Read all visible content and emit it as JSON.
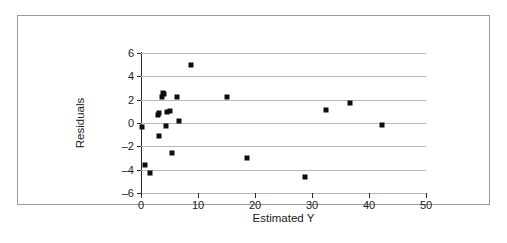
{
  "figure": {
    "border_color": "#9a9a9a",
    "background": "#ffffff"
  },
  "ghost_caption": "",
  "chart_data": {
    "type": "scatter",
    "title": "",
    "xlabel": "Estimated Y",
    "ylabel": "Residuals",
    "xlim": [
      0,
      50
    ],
    "ylim": [
      -6,
      6
    ],
    "xticks": [
      0,
      10,
      20,
      30,
      40,
      50
    ],
    "yticks": [
      -6,
      -4,
      -2,
      0,
      2,
      4,
      6
    ],
    "xtick_labels": [
      "0",
      "10",
      "20",
      "30",
      "40",
      "50"
    ],
    "ytick_labels": [
      "-6",
      "-4",
      "-2",
      "0",
      "2",
      "4",
      "6"
    ],
    "gridlines": {
      "horizontal": true,
      "vertical": false,
      "color": "#b9b9b9",
      "values": [
        -6,
        -4,
        -2,
        0,
        2,
        4,
        6
      ]
    },
    "marker": {
      "shape": "square",
      "color": "#0d0d0d",
      "size_px": 5
    },
    "series": [
      {
        "name": "Residuals",
        "points": [
          [
            0.2,
            -0.35
          ],
          [
            0.7,
            -3.6
          ],
          [
            1.5,
            -4.3
          ],
          [
            2.9,
            0.7
          ],
          [
            3.1,
            0.85
          ],
          [
            3.2,
            -1.1
          ],
          [
            3.6,
            2.2
          ],
          [
            3.9,
            2.55
          ],
          [
            4.1,
            2.45
          ],
          [
            4.3,
            -0.25
          ],
          [
            4.6,
            0.95
          ],
          [
            5.1,
            1.0
          ],
          [
            5.5,
            -2.6
          ],
          [
            6.3,
            2.25
          ],
          [
            6.6,
            0.2
          ],
          [
            8.7,
            5.0
          ],
          [
            15.0,
            2.2
          ],
          [
            18.6,
            -3.0
          ],
          [
            28.8,
            -4.6
          ],
          [
            32.4,
            1.1
          ],
          [
            36.6,
            1.75
          ],
          [
            42.2,
            -0.15
          ]
        ]
      }
    ]
  }
}
